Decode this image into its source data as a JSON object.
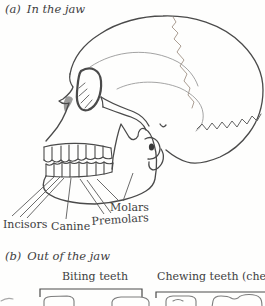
{
  "sections": {
    "a": {
      "label": "(a)",
      "title": "In the jaw"
    },
    "b": {
      "label": "(b)",
      "title": "Out of the jaw"
    }
  },
  "tooth_labels": {
    "incisors": "Incisors",
    "canine": "Canine",
    "premolars": "Premolars",
    "molars": "Molars"
  },
  "tooth_groups": {
    "biting": "Biting teeth",
    "chewing": "Chewing teeth (cheek"
  },
  "colors": {
    "ink": "#3d3d3d",
    "skull_outline": "#4a4a4a",
    "suture_light": "#9a9a9a",
    "background": "#fefefd"
  }
}
